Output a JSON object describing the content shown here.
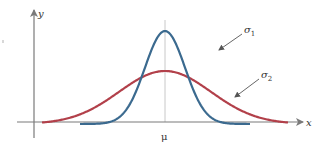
{
  "diagram": {
    "axes": {
      "x_label": "x",
      "y_label": "y",
      "mean_label": "μ"
    },
    "curves": [
      {
        "name": "sigma1",
        "label_base": "σ",
        "label_sub": "1",
        "color": "#3b6a8f",
        "peak_y": 31,
        "spread": 20
      },
      {
        "name": "sigma2",
        "label_base": "σ",
        "label_sub": "2",
        "color": "#b2404a",
        "peak_y": 71,
        "spread": 46
      }
    ],
    "colors": {
      "axis": "#7a7a7a",
      "mean_line": "#c8c8c8",
      "text": "#333333",
      "arrow": "#555555"
    }
  },
  "chart_data": {
    "type": "line",
    "title": "",
    "xlabel": "x",
    "ylabel": "y",
    "annotations": [
      "μ",
      "σ1",
      "σ2"
    ],
    "series": [
      {
        "name": "σ1",
        "description": "narrow normal curve, taller peak at μ",
        "relative_peak": 1.0
      },
      {
        "name": "σ2",
        "description": "wide normal curve, lower peak at μ",
        "relative_peak": 0.55
      }
    ],
    "grid": false,
    "legend": "inline arrows"
  }
}
